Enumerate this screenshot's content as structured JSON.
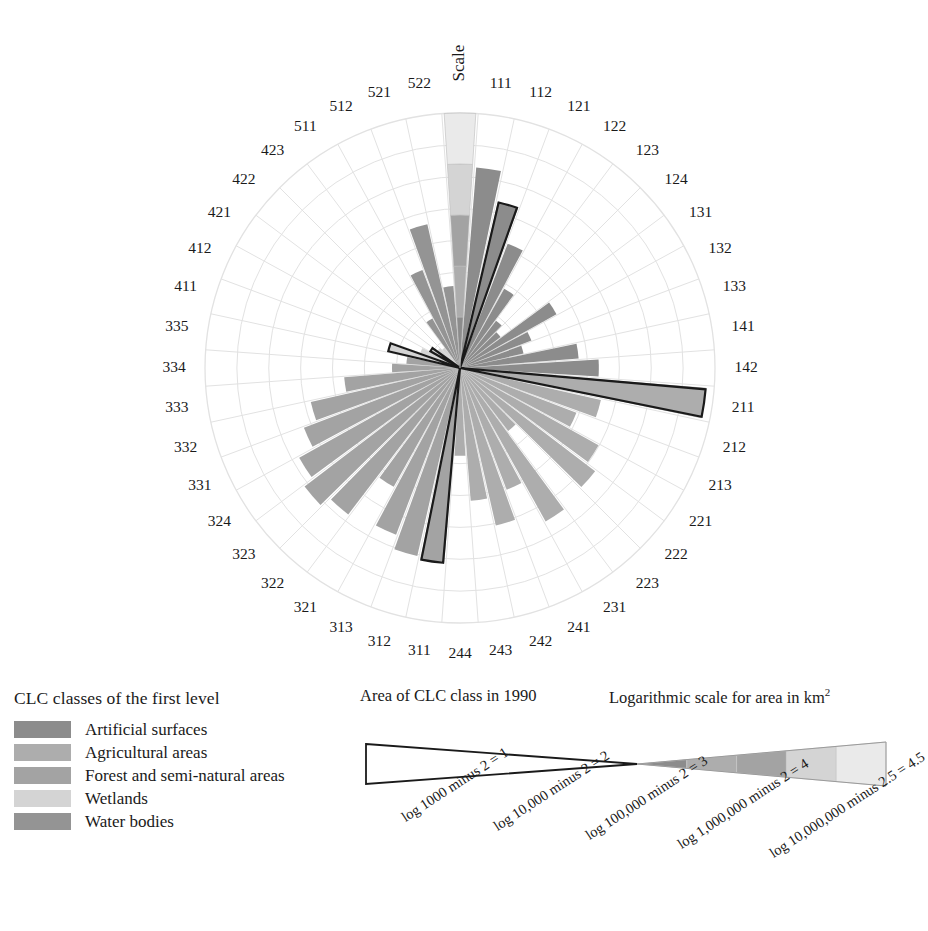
{
  "figure": {
    "scale_word": "Scale",
    "center": {
      "cx": 460,
      "cy": 368
    },
    "r_max": 255,
    "rings": 8
  },
  "chart_data": {
    "type": "bar",
    "subtype": "polar-rose",
    "title": "Scale",
    "xlabel": "CLC class code",
    "ylabel": "Logarithmic scale for area in km²",
    "grid": true,
    "legend_position": "below-left",
    "rlim": [
      0,
      4.5
    ],
    "categories": [
      "111",
      "112",
      "121",
      "122",
      "123",
      "124",
      "131",
      "132",
      "133",
      "141",
      "142",
      "211",
      "212",
      "213",
      "221",
      "222",
      "223",
      "231",
      "241",
      "242",
      "243",
      "244",
      "311",
      "312",
      "313",
      "321",
      "322",
      "323",
      "324",
      "331",
      "332",
      "333",
      "334",
      "335",
      "411",
      "412",
      "421",
      "422",
      "423",
      "511",
      "512",
      "521",
      "522"
    ],
    "series": [
      {
        "name": "Area of CLC class in 1990 (log scale)",
        "note": "radius = log10(area km2) rescaled; 0 = centre, 4.5 = outer ring",
        "values": [
          3.55,
          3.0,
          2.35,
          1.6,
          1.05,
          0.9,
          1.95,
          1.35,
          1.15,
          2.1,
          2.45,
          4.35,
          2.55,
          2.2,
          2.8,
          3.0,
          1.4,
          3.1,
          2.3,
          2.85,
          2.35,
          1.55,
          3.45,
          3.4,
          3.15,
          2.4,
          3.25,
          3.45,
          3.25,
          2.95,
          2.7,
          2.05,
          1.2,
          0.95,
          1.3,
          0.75,
          0.6,
          0.5,
          0.45,
          1.0,
          1.85,
          2.6,
          1.45
        ]
      }
    ],
    "class_of_each_category": [
      "1",
      "1",
      "1",
      "1",
      "1",
      "1",
      "1",
      "1",
      "1",
      "1",
      "1",
      "2",
      "2",
      "2",
      "2",
      "2",
      "2",
      "2",
      "2",
      "2",
      "2",
      "2",
      "3",
      "3",
      "3",
      "3",
      "3",
      "3",
      "3",
      "3",
      "3",
      "3",
      "3",
      "3",
      "4",
      "4",
      "4",
      "4",
      "4",
      "5",
      "5",
      "5",
      "5"
    ],
    "highlighted_categories": [
      "112",
      "211",
      "311",
      "411",
      "421"
    ],
    "highlight_note": "black outlined wedges"
  },
  "axis_labels": [
    "111",
    "112",
    "121",
    "122",
    "123",
    "124",
    "131",
    "132",
    "133",
    "141",
    "142",
    "211",
    "212",
    "213",
    "221",
    "222",
    "223",
    "231",
    "241",
    "242",
    "243",
    "244",
    "311",
    "312",
    "313",
    "321",
    "322",
    "323",
    "324",
    "331",
    "332",
    "333",
    "334",
    "335",
    "411",
    "412",
    "421",
    "422",
    "423",
    "511",
    "512",
    "521",
    "522"
  ],
  "clc_legend": {
    "title": "CLC classes of the first level",
    "items": [
      {
        "label": "Artificial surfaces",
        "color": "#8c8c8c"
      },
      {
        "label": "Agricultural areas",
        "color": "#adadad"
      },
      {
        "label": "Forest and semi-natural areas",
        "color": "#a3a3a3"
      },
      {
        "label": "Wetlands",
        "color": "#d4d4d4"
      },
      {
        "label": "Water bodies",
        "color": "#949494"
      }
    ]
  },
  "scale_legend": {
    "heading_left": "Area of CLC class in 1990",
    "heading_right_main": "Logarithmic scale for area in km",
    "heading_right_sup": "2",
    "ticks": [
      "log 1000 minus 2 = 1",
      "log 10,000 minus 2 = 2",
      "log 100,000 minus 2 = 3",
      "log 1,000,000 minus 2 = 4",
      "log 10,000,000 minus 2.5 = 4.5"
    ],
    "band_colors": [
      "#8c8c8c",
      "#adadad",
      "#a3a3a3",
      "#d4d4d4",
      "#eaeaea"
    ]
  },
  "colors": {
    "artificial": "#8c8c8c",
    "agricultural": "#adadad",
    "forest": "#a3a3a3",
    "wetlands": "#d4d4d4",
    "water": "#949494",
    "grid": "#e2e2e2",
    "outline": "#1a1a1a",
    "scale_bands": [
      "#8c8c8c",
      "#adadad",
      "#a3a3a3",
      "#d4d4d4",
      "#eaeaea"
    ]
  }
}
